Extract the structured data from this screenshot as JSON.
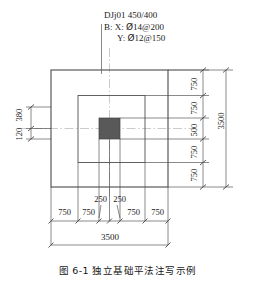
{
  "figure": {
    "caption": "图 6-1   独立基础平法注写示例",
    "annotation": {
      "line1": "DJj01 450/400",
      "line2": "B: X: Ѣ0914@200",
      "line2_prefix": "B: X: ",
      "line2_bar": "Ø",
      "line2_rest": "14@200",
      "line3_prefix": "Y: ",
      "line3_bar": "Ø",
      "line3_rest": "12@150"
    }
  },
  "dimensions": {
    "bottom_chain": [
      "750",
      "750",
      "250",
      "250",
      "750",
      "750"
    ],
    "bottom_total": "3500",
    "right_chain": [
      "750",
      "750",
      "500",
      "750",
      "750"
    ],
    "right_total": "3500",
    "left_chain": [
      "120",
      "380"
    ]
  },
  "colors": {
    "line": "#4a4a4a",
    "column_fill": "#595959",
    "text": "#1a1a1a",
    "center_line": "#9a9a9a"
  }
}
